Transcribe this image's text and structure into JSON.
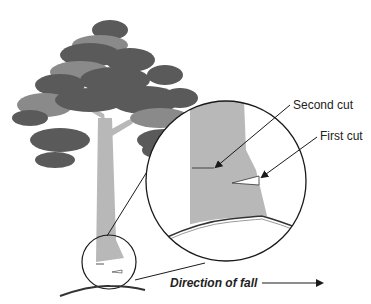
{
  "diagram": {
    "labels": {
      "second_cut": "Second cut",
      "first_cut": "First cut",
      "direction": "Direction of fall"
    },
    "colors": {
      "foliage_dark": "#5a5a5a",
      "foliage_mid": "#8a8a8a",
      "trunk": "#b8b8b8",
      "line": "#1a1a1a"
    }
  }
}
